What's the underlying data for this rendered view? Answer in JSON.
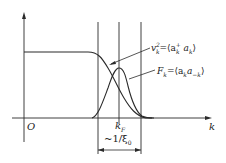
{
  "diagram": {
    "axes": {
      "origin_label": "O",
      "x_label": "k"
    },
    "markers": {
      "kF_label": "k",
      "kF_sub": "F",
      "width_label": "~1/ξ",
      "width_sub": "0"
    },
    "curves": [
      {
        "name": "occupation",
        "label_lhs": "v",
        "label_lhs_sub": "k",
        "label_lhs_sup": "2",
        "label_rhs": "=⟨a",
        "label_rhs_sub1": "k",
        "label_rhs_sup1": "+",
        "label_rhs_mid": " a",
        "label_rhs_sub2": "k",
        "label_rhs_end": "⟩"
      },
      {
        "name": "pair-amplitude",
        "label_lhs": "F",
        "label_lhs_sub": "k",
        "label_rhs": "=⟨a",
        "label_rhs_sub1": "k",
        "label_rhs_mid": "a",
        "label_rhs_sub2": "−k",
        "label_rhs_end": "⟩"
      }
    ],
    "colors": {
      "line": "#2a2a2a",
      "background": "#ffffff"
    }
  }
}
